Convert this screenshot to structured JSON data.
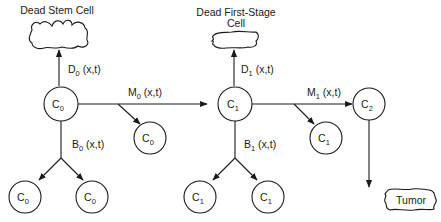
{
  "diagram": {
    "type": "cell-lineage flow diagram",
    "colors": {
      "stroke": "#1a1a1a",
      "background": "#ffffff"
    },
    "outcomes": {
      "dead_stem": {
        "label": "Dead Stem Cell"
      },
      "dead_first": {
        "line1": "Dead First-Stage",
        "line2": "Cell"
      },
      "tumor": {
        "label": "Tumor"
      }
    },
    "nodes": {
      "c0_main": {
        "base": "C",
        "sub": "0"
      },
      "c0_mut_child": {
        "base": "C",
        "sub": "0"
      },
      "c0_birth_left": {
        "base": "C",
        "sub": "0"
      },
      "c0_birth_right": {
        "base": "C",
        "sub": "0"
      },
      "c1_main": {
        "base": "C",
        "sub": "1"
      },
      "c1_mut_child": {
        "base": "C",
        "sub": "1"
      },
      "c1_birth_left": {
        "base": "C",
        "sub": "1"
      },
      "c1_birth_right": {
        "base": "C",
        "sub": "1"
      },
      "c2_main": {
        "base": "C",
        "sub": "2"
      }
    },
    "rates": {
      "d0": {
        "base": "D",
        "sub": "0",
        "args": " (x,t)"
      },
      "m0": {
        "base": "M",
        "sub": "0",
        "args": " (x,t)"
      },
      "b0": {
        "base": "B",
        "sub": "0",
        "args": " (x,t)"
      },
      "d1": {
        "base": "D",
        "sub": "1",
        "args": " (x,t)"
      },
      "m1": {
        "base": "M",
        "sub": "1",
        "args": " (x,t)"
      },
      "b1": {
        "base": "B",
        "sub": "1",
        "args": " (x,t)"
      }
    }
  }
}
